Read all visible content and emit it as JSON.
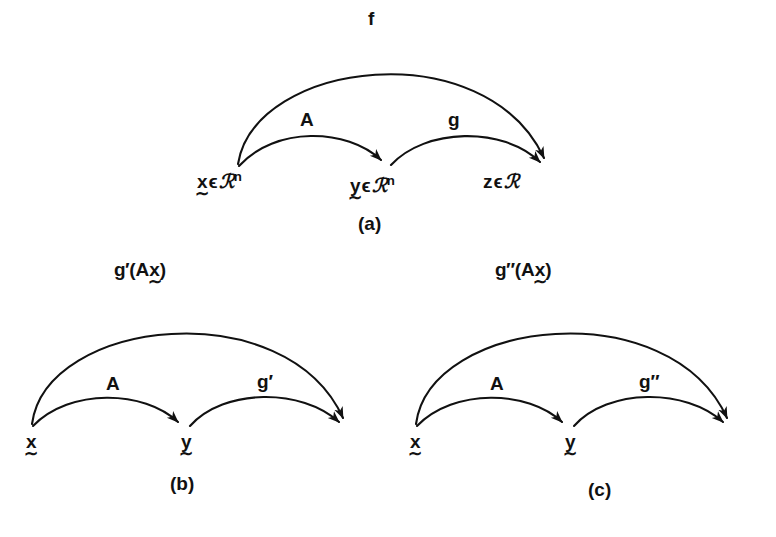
{
  "figure": {
    "background_color": "#ffffff",
    "ink_color": "#111111",
    "panels": [
      {
        "id": "a",
        "caption": "(a)",
        "outer_arc_label": "f",
        "left_arc_label": "A",
        "right_arc_label": "g",
        "nodes": [
          {
            "id": "x",
            "symbol": "x",
            "vector": true,
            "member": "ϵ",
            "set": "ℛ",
            "exponent": "n",
            "text": "x ϵ ℛⁿ"
          },
          {
            "id": "y",
            "symbol": "y",
            "vector": true,
            "member": "ϵ",
            "set": "ℛ",
            "exponent": "n",
            "text": "y ϵ ℛⁿ"
          },
          {
            "id": "z",
            "symbol": "z",
            "vector": false,
            "member": "ϵ",
            "set": "ℛ",
            "exponent": "",
            "text": "z ϵ ℛ"
          }
        ]
      },
      {
        "id": "b",
        "caption": "(b)",
        "outer_arc_label_parts": {
          "fn": "g",
          "prime": "′",
          "open": "(A",
          "arg": "x",
          "close": ")"
        },
        "outer_arc_label": "g′(Ax̰)",
        "left_arc_label": "A",
        "right_arc_label": "g′",
        "nodes": [
          {
            "id": "x",
            "symbol": "x",
            "vector": true,
            "text": "x"
          },
          {
            "id": "y",
            "symbol": "y",
            "vector": true,
            "text": "y"
          }
        ]
      },
      {
        "id": "c",
        "caption": "(c)",
        "outer_arc_label_parts": {
          "fn": "g",
          "prime": "″",
          "open": "(A",
          "arg": "x",
          "close": ")"
        },
        "outer_arc_label": "g″(Ax̰)",
        "left_arc_label": "A",
        "right_arc_label": "g″",
        "nodes": [
          {
            "id": "x",
            "symbol": "x",
            "vector": true,
            "text": "x"
          },
          {
            "id": "y",
            "symbol": "y",
            "vector": true,
            "text": "y"
          }
        ]
      }
    ],
    "glyphs": {
      "tilde": "∼",
      "element_of": "ϵ",
      "script_r": "ℛ",
      "prime_single": "′",
      "prime_double": "″",
      "superscript_n": "n"
    }
  }
}
